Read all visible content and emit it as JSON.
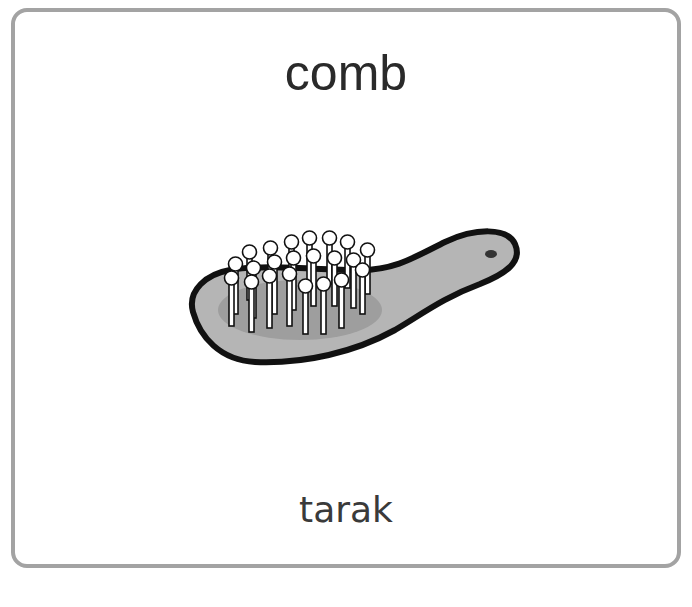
{
  "card": {
    "title": "comb",
    "subtitle": "tarak",
    "image": {
      "icon": "hairbrush-icon",
      "description": "Gray hairbrush with white-tipped bristles"
    }
  },
  "colors": {
    "border": "#a3a3a3",
    "brush_body": "#b5b5b5",
    "brush_pad": "#a0a0a0",
    "outline": "#111111",
    "bristle_tip": "#ffffff"
  }
}
